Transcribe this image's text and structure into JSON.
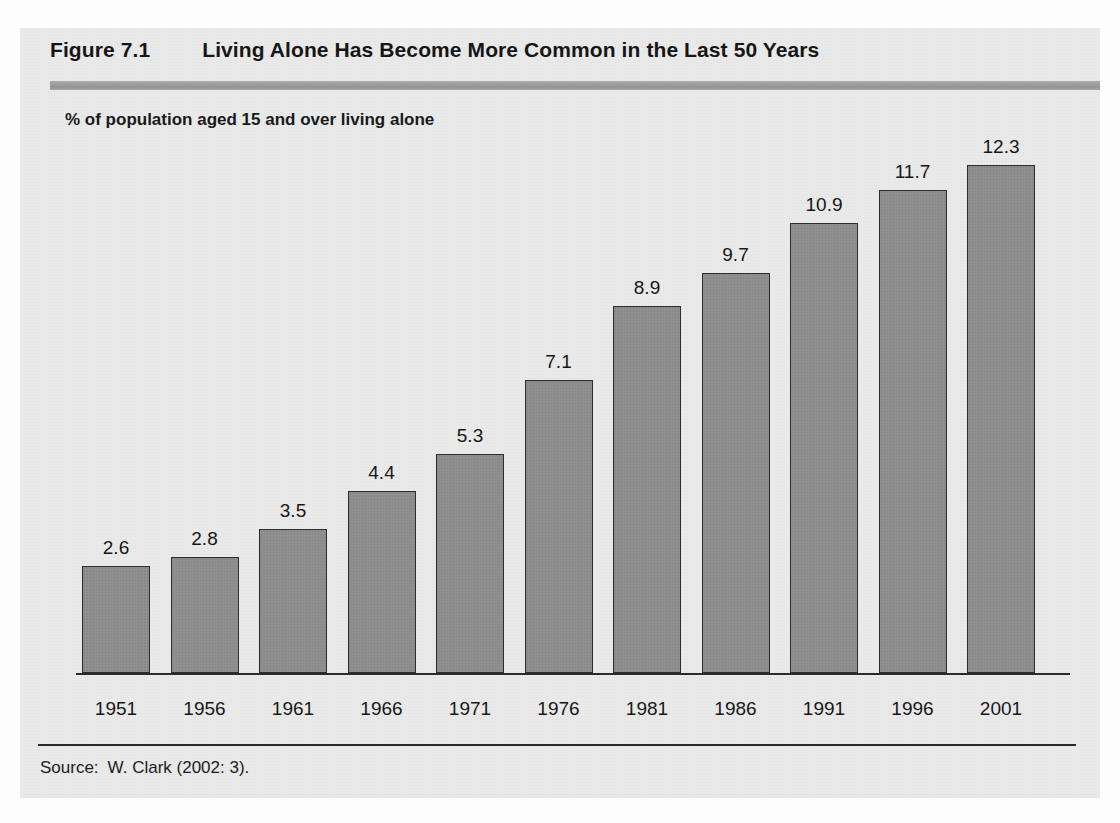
{
  "figure": {
    "number": "Figure 7.1",
    "title": "Living Alone Has Become More Common in the Last 50 Years",
    "subtitle": "% of population aged 15 and over living alone",
    "source_label": "Source:",
    "source_text": "W. Clark (2002: 3)."
  },
  "colors": {
    "panel_background": "#e9e9e9",
    "header_rule": "#9a9a9a",
    "bar_fill": "#8e8e8e",
    "bar_border": "#2c2c2c",
    "axis": "#2b2b2b",
    "text": "#171717"
  },
  "chart_data": {
    "type": "bar",
    "title": "Living Alone Has Become More Common in the Last 50 Years",
    "subtitle": "% of population aged 15 and over living alone",
    "xlabel": "",
    "ylabel": "% of population aged 15 and over living alone",
    "ylim": [
      0,
      13.2
    ],
    "grid": false,
    "legend": false,
    "data_labels": true,
    "categories": [
      "1951",
      "1956",
      "1961",
      "1966",
      "1971",
      "1976",
      "1981",
      "1986",
      "1991",
      "1996",
      "2001"
    ],
    "values": [
      2.6,
      2.8,
      3.5,
      4.4,
      5.3,
      7.1,
      8.9,
      9.7,
      10.9,
      11.7,
      12.3
    ],
    "value_labels": [
      "2.6",
      "2.8",
      "3.5",
      "4.4",
      "5.3",
      "7.1",
      "8.9",
      "9.7",
      "10.9",
      "11.7",
      "12.3"
    ],
    "source": "W. Clark (2002: 3)."
  }
}
